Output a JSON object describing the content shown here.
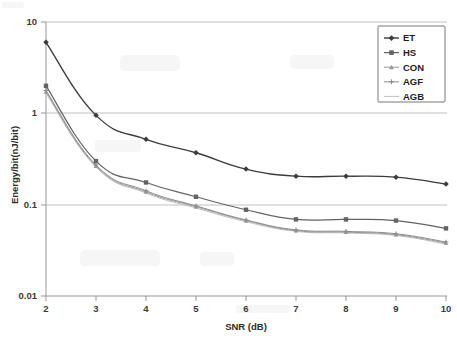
{
  "chart_data": {
    "type": "line",
    "title": "",
    "xlabel": "SNR (dB)",
    "ylabel": "Energy/bit(nJ/bit)",
    "x": [
      2,
      3,
      4,
      5,
      6,
      7,
      8,
      9,
      10
    ],
    "xlim": [
      2,
      10
    ],
    "ylim": [
      0.01,
      10
    ],
    "yscale": "log",
    "xscale": "linear",
    "xtick_labels": [
      "2",
      "3",
      "4",
      "5",
      "6",
      "7",
      "8",
      "9",
      "10"
    ],
    "ytick_labels": [
      "0.01",
      "0.1",
      "1",
      "10"
    ],
    "ytick_values": [
      0.01,
      0.1,
      1,
      10
    ],
    "grid": "horizontal",
    "legend_position": "top-right",
    "series": [
      {
        "name": "ET",
        "color": "#3b3b3b",
        "marker": "diamond",
        "values": [
          6.0,
          0.95,
          0.52,
          0.37,
          0.245,
          0.205,
          0.205,
          0.2,
          0.168
        ]
      },
      {
        "name": "HS",
        "color": "#636363",
        "marker": "square",
        "values": [
          2.0,
          0.3,
          0.175,
          0.122,
          0.088,
          0.069,
          0.069,
          0.067,
          0.055
        ]
      },
      {
        "name": "CON",
        "color": "#9a9a9a",
        "marker": "triangle",
        "values": [
          1.72,
          0.265,
          0.138,
          0.095,
          0.067,
          0.052,
          0.05,
          0.047,
          0.038
        ]
      },
      {
        "name": "AGF",
        "color": "#8c8c8c",
        "marker": "cross",
        "values": [
          1.78,
          0.272,
          0.142,
          0.097,
          0.068,
          0.053,
          0.051,
          0.048,
          0.039
        ]
      },
      {
        "name": "AGB",
        "color": "#bdbdbd",
        "marker": "line",
        "values": [
          1.66,
          0.258,
          0.134,
          0.092,
          0.065,
          0.051,
          0.049,
          0.046,
          0.037
        ]
      }
    ]
  },
  "legend": {
    "entries": [
      "ET",
      "HS",
      "CON",
      "AGF",
      "AGB"
    ]
  },
  "axes": {
    "x_title": "SNR (dB)",
    "y_title": "Energy/bit(nJ/bit)"
  }
}
